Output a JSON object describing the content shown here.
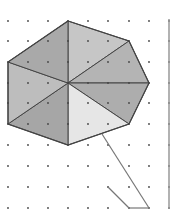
{
  "diagram": {
    "type": "dot-grid polygon fan",
    "grid": {
      "x": [
        8,
        28,
        48,
        68,
        88,
        108,
        129,
        149
      ],
      "y": [
        21,
        41,
        62,
        83,
        103,
        124,
        145,
        166,
        187,
        208
      ],
      "dot_color": "#444444"
    },
    "center": [
      68,
      83
    ],
    "polygon_vertices": [
      [
        68,
        21
      ],
      [
        129,
        41
      ],
      [
        149,
        83
      ],
      [
        129,
        124
      ],
      [
        68,
        145
      ],
      [
        8,
        124
      ],
      [
        8,
        62
      ]
    ],
    "triangles": [
      {
        "name": "top-right",
        "points": [
          [
            68,
            21
          ],
          [
            129,
            41
          ],
          [
            68,
            83
          ]
        ],
        "fill": "#c6c6c6"
      },
      {
        "name": "right-upper",
        "points": [
          [
            129,
            41
          ],
          [
            149,
            83
          ],
          [
            68,
            83
          ]
        ],
        "fill": "#b4b4b4"
      },
      {
        "name": "right-lower",
        "points": [
          [
            149,
            83
          ],
          [
            129,
            124
          ],
          [
            68,
            83
          ]
        ],
        "fill": "#adadad"
      },
      {
        "name": "bottom-right",
        "points": [
          [
            129,
            124
          ],
          [
            68,
            145
          ],
          [
            68,
            83
          ]
        ],
        "fill": "#e6e6e6"
      },
      {
        "name": "bottom-left",
        "points": [
          [
            68,
            145
          ],
          [
            8,
            124
          ],
          [
            68,
            83
          ]
        ],
        "fill": "#a6a6a6"
      },
      {
        "name": "left",
        "points": [
          [
            8,
            124
          ],
          [
            8,
            62
          ],
          [
            68,
            83
          ]
        ],
        "fill": "#bdbdbd"
      },
      {
        "name": "top-left",
        "points": [
          [
            8,
            62
          ],
          [
            68,
            21
          ],
          [
            68,
            83
          ]
        ],
        "fill": "#a9a9a9"
      }
    ],
    "edge_color": "#444444",
    "extra_lines": [
      {
        "name": "handle-long",
        "from": [
          102,
          134
        ],
        "to": [
          149,
          208
        ]
      },
      {
        "name": "handle-short",
        "from": [
          108,
          187
        ],
        "to": [
          129,
          208
        ]
      },
      {
        "name": "handle-base",
        "from": [
          129,
          208
        ],
        "to": [
          149,
          208
        ]
      }
    ],
    "right_border": {
      "x": 169,
      "y1": 19,
      "y2": 209,
      "color": "#999999"
    }
  }
}
